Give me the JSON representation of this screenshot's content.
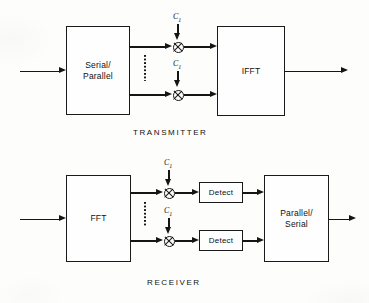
{
  "figure": {
    "type": "block-diagram",
    "background_color": "#fdfdfc",
    "line_color": "#151515"
  },
  "transmitter": {
    "section_label": "TRANSMITTER",
    "blocks": {
      "serial_parallel": "Serial/\nParallel",
      "ifft": "IFFT"
    },
    "coefficients": {
      "top": "C",
      "top_sub": "1",
      "bottom": "C",
      "bottom_sub": "1"
    },
    "multiplier_symbol": "⊗",
    "ellipsis": "vertical-dots"
  },
  "receiver": {
    "section_label": "RECEIVER",
    "blocks": {
      "fft": "FFT",
      "detect_top": "Detect",
      "detect_bottom": "Detect",
      "parallel_serial": "Parallel/\nSerial"
    },
    "coefficients": {
      "top": "C",
      "top_sub": "1",
      "bottom": "C",
      "bottom_sub": "1"
    },
    "multiplier_symbol": "⊗",
    "ellipsis": "vertical-dots"
  }
}
